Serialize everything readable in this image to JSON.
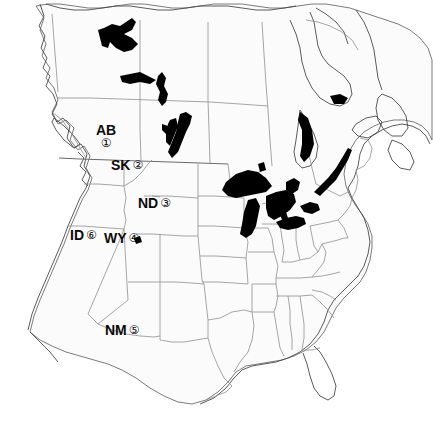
{
  "figure": {
    "kind": "reference-map",
    "background_color": "#ffffff",
    "ink_color": "#0b0b0b",
    "land_fill": "#fbfbfb",
    "boundary_color": "#8a8a8a",
    "coastline_color": "#4a4a4a",
    "water_fill": "#000000"
  },
  "labels": [
    {
      "id": "ab",
      "abbr": "AB",
      "number": "①",
      "layout": "stack",
      "region_name": "Alberta",
      "x": 96,
      "y": 123
    },
    {
      "id": "sk",
      "abbr": "SK",
      "number": "②",
      "layout": "row",
      "region_name": "Saskatchewan",
      "x": 111,
      "y": 158
    },
    {
      "id": "nd",
      "abbr": "ND",
      "number": "③",
      "layout": "row",
      "region_name": "North Dakota",
      "x": 138,
      "y": 196
    },
    {
      "id": "id",
      "abbr": "ID",
      "number": "⑥",
      "layout": "row",
      "region_name": "Idaho",
      "x": 70,
      "y": 228
    },
    {
      "id": "wy",
      "abbr": "WY",
      "number": "④",
      "layout": "row",
      "region_name": "Wyoming",
      "x": 104,
      "y": 231
    },
    {
      "id": "nm",
      "abbr": "NM",
      "number": "⑤",
      "layout": "row",
      "region_name": "New Mexico",
      "x": 105,
      "y": 323
    }
  ],
  "water_bodies": [
    "Great Slave Lake",
    "Lake Athabasca",
    "Reindeer Lake",
    "Lake Winnipeg",
    "Lake Winnipegosis",
    "Lake Superior",
    "Lake Michigan",
    "Lake Huron",
    "Lake Erie",
    "Lake Ontario",
    "Georgian Bay",
    "James Bay",
    "St. Lawrence River",
    "Great Salt Lake"
  ]
}
